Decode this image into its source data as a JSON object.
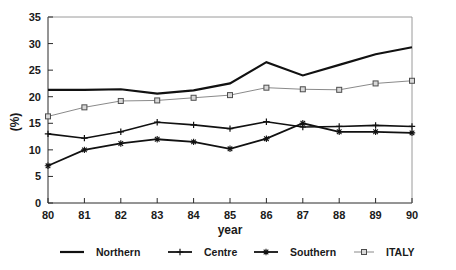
{
  "chart_data": {
    "type": "line",
    "title": "",
    "xlabel": "year",
    "ylabel": "(%)",
    "xlim": [
      80,
      90
    ],
    "ylim": [
      0,
      35
    ],
    "yticks": [
      0,
      5,
      10,
      15,
      20,
      25,
      30,
      35
    ],
    "grid": false,
    "legend_position": "bottom",
    "categories": [
      "80",
      "81",
      "82",
      "83",
      "84",
      "85",
      "86",
      "87",
      "88",
      "89",
      "90"
    ],
    "x": [
      80,
      81,
      82,
      83,
      84,
      85,
      86,
      87,
      88,
      89,
      90
    ],
    "series": [
      {
        "name": "Northern",
        "marker": "none",
        "color": "#111111",
        "width": 2.2,
        "values": [
          21.3,
          21.3,
          21.4,
          20.6,
          21.2,
          22.5,
          26.5,
          24.0,
          26.0,
          28.0,
          29.3
        ]
      },
      {
        "name": "Centre",
        "marker": "plus",
        "color": "#111111",
        "width": 1.6,
        "values": [
          13.0,
          12.2,
          13.4,
          15.2,
          14.7,
          14.0,
          15.3,
          14.3,
          14.4,
          14.6,
          14.4
        ]
      },
      {
        "name": "Southern",
        "marker": "star",
        "color": "#111111",
        "width": 1.8,
        "values": [
          7.0,
          10.0,
          11.2,
          12.0,
          11.5,
          10.2,
          12.1,
          15.0,
          13.4,
          13.4,
          13.2
        ]
      },
      {
        "name": "ITALY",
        "marker": "square",
        "color": "#8a8a8a",
        "width": 1.0,
        "values": [
          16.3,
          18.0,
          19.2,
          19.3,
          19.8,
          20.3,
          21.7,
          21.4,
          21.3,
          22.5,
          23.0
        ]
      }
    ]
  },
  "axes": {
    "y_title": "(%)",
    "x_title": "year",
    "y_tick_labels": [
      "0",
      "5",
      "10",
      "15",
      "20",
      "25",
      "30",
      "35"
    ],
    "x_tick_labels": [
      "80",
      "81",
      "82",
      "83",
      "84",
      "85",
      "86",
      "87",
      "88",
      "89",
      "90"
    ]
  },
  "legend": {
    "items": [
      {
        "label": "Northern",
        "marker": "none",
        "color": "#111111"
      },
      {
        "label": "Centre",
        "marker": "plus",
        "color": "#111111"
      },
      {
        "label": "Southern",
        "marker": "star",
        "color": "#111111"
      },
      {
        "label": "ITALY",
        "marker": "square",
        "color": "#8a8a8a"
      }
    ]
  }
}
